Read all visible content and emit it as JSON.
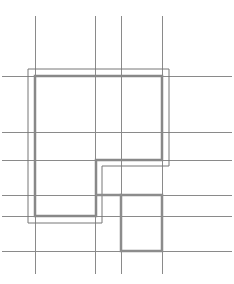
{
  "diagram": {
    "width": 234,
    "height": 284,
    "background": "#ffffff",
    "grid": {
      "color": "#8a8a8a",
      "stroke_width": 1,
      "vertical_lines": [
        {
          "x": 35,
          "y1": 16,
          "y2": 274
        },
        {
          "x": 95,
          "y1": 16,
          "y2": 274
        },
        {
          "x": 121,
          "y1": 16,
          "y2": 274
        },
        {
          "x": 162,
          "y1": 16,
          "y2": 274
        }
      ],
      "horizontal_lines": [
        {
          "y": 76,
          "x1": 2,
          "x2": 232
        },
        {
          "y": 132,
          "x1": 2,
          "x2": 232
        },
        {
          "y": 160,
          "x1": 2,
          "x2": 232
        },
        {
          "y": 195,
          "x1": 2,
          "x2": 232
        },
        {
          "y": 216,
          "x1": 2,
          "x2": 232
        },
        {
          "y": 251,
          "x1": 2,
          "x2": 232
        }
      ]
    },
    "outer_outline": {
      "color": "#777777",
      "stroke_width": 1,
      "points": "28,69 169,69 169,166 102,166 102,223 28,223"
    },
    "main_region": {
      "color": "#888888",
      "stroke_width": 2.5,
      "points": "35,76 162,76 162,160 96,160 96,216 35,216"
    },
    "lower_region": {
      "color": "#8c8c8c",
      "stroke_width": 2.5,
      "points": "121,195 162,195 162,251 121,251"
    },
    "connector_region": {
      "color": "#8c8c8c",
      "stroke_width": 2.5,
      "points": "96,195 121,195"
    }
  }
}
